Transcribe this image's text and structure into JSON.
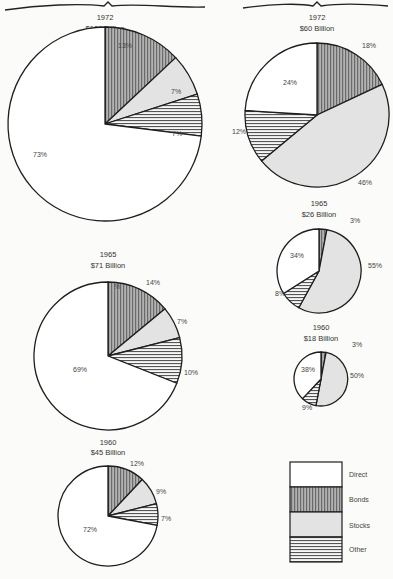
{
  "chart_data": [
    {
      "type": "pie",
      "group": "left",
      "title": "1972",
      "subtitle": "$128 Billion",
      "categories": [
        "Bonds",
        "Stocks",
        "Other",
        "Direct"
      ],
      "values": [
        13,
        7,
        7,
        73
      ],
      "labels": [
        "13%",
        "7%",
        "7%",
        "73%"
      ],
      "cx": 105,
      "cy": 124,
      "r": 97,
      "label_pos": [
        [
          118,
          48
        ],
        [
          171,
          94
        ],
        [
          172,
          136
        ],
        [
          33,
          157
        ]
      ],
      "title_y": 20,
      "subtitle_y": 31
    },
    {
      "type": "pie",
      "group": "left",
      "title": "1965",
      "subtitle": "$71 Billion",
      "categories": [
        "Bonds",
        "Stocks",
        "Other",
        "Direct"
      ],
      "values": [
        14,
        7,
        10,
        69
      ],
      "labels": [
        "14%",
        "7%",
        "10%",
        "69%"
      ],
      "extra_label": {
        "text": "%",
        "x": 114,
        "y": 289
      },
      "cx": 108,
      "cy": 356,
      "r": 74,
      "label_pos": [
        [
          146,
          285
        ],
        [
          177,
          324
        ],
        [
          184,
          375
        ],
        [
          73,
          372
        ]
      ],
      "title_y": 257,
      "subtitle_y": 268
    },
    {
      "type": "pie",
      "group": "left",
      "title": "1960",
      "subtitle": "$45 Billion",
      "categories": [
        "Bonds",
        "Stocks",
        "Other",
        "Direct"
      ],
      "values": [
        12,
        9,
        7,
        72
      ],
      "labels": [
        "12%",
        "9%",
        "7%",
        "72%"
      ],
      "cx": 108,
      "cy": 516,
      "r": 50,
      "label_pos": [
        [
          130,
          466
        ],
        [
          156,
          494
        ],
        [
          161,
          521
        ],
        [
          83,
          532
        ]
      ],
      "title_y": 445,
      "subtitle_y": 455
    },
    {
      "type": "pie",
      "group": "right",
      "title": "1972",
      "subtitle": "$60 Billion",
      "categories": [
        "Bonds",
        "Stocks",
        "Other",
        "Direct"
      ],
      "values": [
        18,
        46,
        12,
        24
      ],
      "labels": [
        "18%",
        "46%",
        "12%",
        "24%"
      ],
      "cx": 317,
      "cy": 115,
      "r": 72,
      "label_pos": [
        [
          362,
          48
        ],
        [
          358,
          185
        ],
        [
          232,
          134
        ],
        [
          283,
          85
        ]
      ],
      "title_y": 20,
      "subtitle_y": 31
    },
    {
      "type": "pie",
      "group": "right",
      "title": "1965",
      "subtitle": "$26 Billion",
      "categories": [
        "Bonds",
        "Stocks",
        "Other",
        "Direct"
      ],
      "values": [
        3,
        55,
        8,
        34
      ],
      "labels": [
        "3%",
        "55%",
        "8%",
        "34%"
      ],
      "cx": 319,
      "cy": 271,
      "r": 42,
      "label_pos": [
        [
          350,
          223
        ],
        [
          368,
          268
        ],
        [
          275,
          296
        ],
        [
          290,
          258
        ]
      ],
      "title_y": 206,
      "subtitle_y": 217
    },
    {
      "type": "pie",
      "group": "right",
      "title": "1960",
      "subtitle": "$18 Billion",
      "categories": [
        "Bonds",
        "Stocks",
        "Other",
        "Direct"
      ],
      "values": [
        3,
        50,
        9,
        38
      ],
      "labels": [
        "3%",
        "50%",
        "9%",
        "38%"
      ],
      "cx": 321,
      "cy": 379,
      "r": 27,
      "label_pos": [
        [
          352,
          347
        ],
        [
          350,
          378
        ],
        [
          302,
          410
        ],
        [
          301,
          372
        ]
      ],
      "title_y": 330,
      "subtitle_y": 341
    }
  ],
  "legend": {
    "position": "bottom-right",
    "items": [
      {
        "name": "Direct",
        "pattern": "direct"
      },
      {
        "name": "Bonds",
        "pattern": "bonds"
      },
      {
        "name": "Stocks",
        "pattern": "stocks"
      },
      {
        "name": "Other",
        "pattern": "other"
      }
    ]
  },
  "colors": {
    "line": "#1e1e1e",
    "direct": "#ffffff",
    "bonds_fill": "#a9a9a9",
    "bonds_stripe": "#666666",
    "stocks": "#e3e3e3",
    "other_fill": "#f4f4f4",
    "other_stripe": "#555555",
    "background": "#fbfbf9",
    "text": "#444444"
  }
}
